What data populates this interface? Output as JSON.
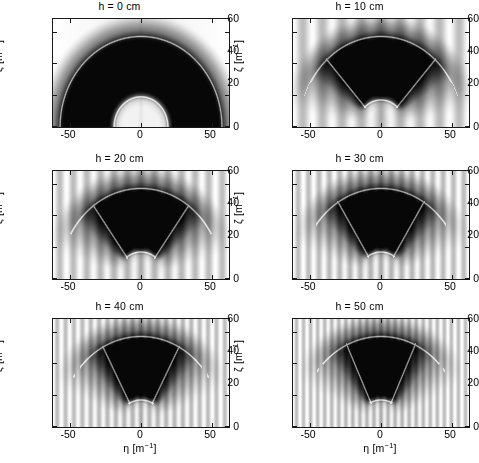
{
  "figure": {
    "type": "scientific-figure",
    "rows": 3,
    "cols": 2,
    "colormap": "grayscale-inverted",
    "background": "#ffffff",
    "axis_color": "#1a1a1a"
  },
  "axes_common": {
    "xlabel_symbol": "η",
    "xlabel_unit": "[m",
    "xlabel_unit_sup": "-1",
    "xlabel_unit_close": "]",
    "ylabel_symbol": "ζ",
    "ylabel_unit": "[m",
    "ylabel_unit_sup": "-1",
    "ylabel_unit_close": "]",
    "xlabel_full": "η [m⁻¹]",
    "ylabel_full": "ζ [m⁻¹]",
    "xticks": [
      "-50",
      "0",
      "50"
    ],
    "xtick_values": [
      -50,
      0,
      50
    ],
    "yticks": [
      "0",
      "20",
      "40",
      "60"
    ],
    "ytick_values": [
      0,
      20,
      40,
      60
    ],
    "xlim": [
      -62,
      62
    ],
    "ylim": [
      0,
      68
    ],
    "grid": false,
    "legend": "none"
  },
  "panels": [
    {
      "id": "panel-h0",
      "title": "h = 0 cm",
      "h_cm": 0,
      "row": 1,
      "col": 1,
      "show_xlabel": false,
      "feature": "semicircle",
      "outer_radius": 57,
      "inner_radius": 19,
      "stripe_count": 0,
      "wedge_half_angle_deg": 90
    },
    {
      "id": "panel-h10",
      "title": "h = 10 cm",
      "h_cm": 10,
      "row": 1,
      "col": 2,
      "show_xlabel": false,
      "feature": "wedge",
      "outer_radius": 57,
      "inner_radius": 17,
      "stripe_count": 9,
      "wedge_half_angle_deg": 42
    },
    {
      "id": "panel-h20",
      "title": "h = 20 cm",
      "h_cm": 20,
      "row": 2,
      "col": 1,
      "show_xlabel": false,
      "feature": "wedge",
      "outer_radius": 57,
      "inner_radius": 17,
      "stripe_count": 13,
      "wedge_half_angle_deg": 36
    },
    {
      "id": "panel-h30",
      "title": "h = 30 cm",
      "h_cm": 30,
      "row": 2,
      "col": 2,
      "show_xlabel": false,
      "feature": "wedge",
      "outer_radius": 57,
      "inner_radius": 17,
      "stripe_count": 17,
      "wedge_half_angle_deg": 32
    },
    {
      "id": "panel-h40",
      "title": "h = 40 cm",
      "h_cm": 40,
      "row": 3,
      "col": 1,
      "show_xlabel": true,
      "feature": "wedge",
      "outer_radius": 57,
      "inner_radius": 17,
      "stripe_count": 21,
      "wedge_half_angle_deg": 28
    },
    {
      "id": "panel-h50",
      "title": "h = 50 cm",
      "h_cm": 50,
      "row": 3,
      "col": 2,
      "show_xlabel": true,
      "feature": "wedge",
      "outer_radius": 57,
      "inner_radius": 17,
      "stripe_count": 25,
      "wedge_half_angle_deg": 25
    }
  ],
  "chart_data": {
    "type": "heatmap",
    "title": "",
    "subtitle": "",
    "xlabel": "η [m⁻¹]",
    "ylabel": "ζ [m⁻¹]",
    "xlim": [
      -62,
      62
    ],
    "ylim": [
      0,
      68
    ],
    "xticks": [
      -50,
      0,
      50
    ],
    "yticks": [
      0,
      20,
      40,
      60
    ],
    "grid": false,
    "legend_position": "none",
    "colormap": "gray_r",
    "panel_variable": "h",
    "panel_unit": "cm",
    "panel_values": [
      0,
      10,
      20,
      30,
      40,
      50
    ],
    "panel_titles": [
      "h = 0 cm",
      "h = 10 cm",
      "h = 20 cm",
      "h = 30 cm",
      "h = 40 cm",
      "h = 50 cm"
    ],
    "annotations": [
      {
        "panel": 0,
        "text": "outer arc radius ≈ 57 m^-1"
      },
      {
        "panel": 0,
        "text": "inner arc radius ≈ 19 m^-1"
      },
      {
        "panel": 1,
        "text": "wedge half-angle ≈ 42 deg"
      },
      {
        "panel": 2,
        "text": "wedge half-angle ≈ 36 deg"
      },
      {
        "panel": 3,
        "text": "wedge half-angle ≈ 32 deg"
      },
      {
        "panel": 4,
        "text": "wedge half-angle ≈ 28 deg"
      },
      {
        "panel": 5,
        "text": "wedge half-angle ≈ 25 deg"
      }
    ]
  }
}
